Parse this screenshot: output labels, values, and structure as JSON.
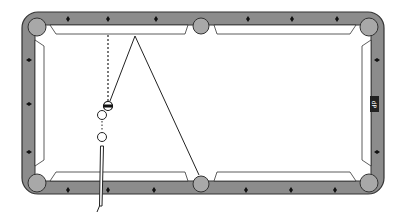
{
  "diagram": {
    "type": "billiards-shot-diagram",
    "colors": {
      "rail": "#8c8c8c",
      "rail_outline": "#333333",
      "pocket": "#a8a8a8",
      "cloth": "#ffffff",
      "line": "#222222"
    },
    "table": {
      "pockets": [
        "top-left",
        "top-middle",
        "top-right",
        "bottom-left",
        "bottom-middle",
        "bottom-right"
      ],
      "diamonds_per_long_rail_half": 3,
      "diamonds_per_short_rail": 3
    },
    "rail_label": "dP",
    "balls": [
      {
        "name": "object-ball",
        "style": "striped"
      },
      {
        "name": "ghost-ball-1",
        "style": "outline"
      },
      {
        "name": "ghost-ball-2",
        "style": "outline"
      }
    ],
    "paths": [
      {
        "name": "aim-line",
        "style": "dashed"
      },
      {
        "name": "object-ball-path",
        "style": "solid"
      },
      {
        "name": "bank-path",
        "style": "solid"
      }
    ],
    "cue": {
      "name": "cue-stick"
    }
  }
}
